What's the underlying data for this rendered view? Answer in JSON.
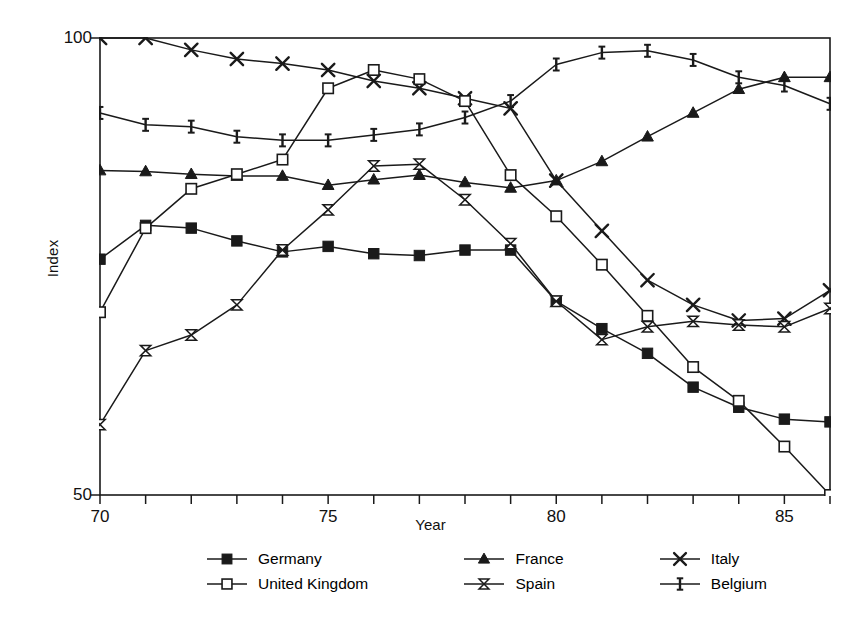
{
  "chart_data": {
    "type": "line",
    "title": "",
    "xlabel": "Year",
    "ylabel": "Index",
    "xlim": [
      70,
      86
    ],
    "ylim": [
      50,
      100
    ],
    "grid": false,
    "legend_position": "bottom",
    "x_tick_labels": [
      "70",
      "75",
      "80",
      "85"
    ],
    "x_tick_values": [
      70,
      75,
      80,
      85
    ],
    "x_minor_ticks": [
      70,
      71,
      72,
      73,
      74,
      75,
      76,
      77,
      78,
      79,
      80,
      81,
      82,
      83,
      84,
      85,
      86
    ],
    "y_tick_labels": [
      "100",
      "50"
    ],
    "y_tick_values": [
      100,
      50
    ],
    "x": [
      70,
      71,
      72,
      73,
      74,
      75,
      76,
      77,
      78,
      79,
      80,
      81,
      82,
      83,
      84,
      85,
      86
    ],
    "series": [
      {
        "name": "Germany",
        "marker": "filled-square",
        "values": [
          75.8,
          79.5,
          79.2,
          77.8,
          76.6,
          77.2,
          76.4,
          76.2,
          76.8,
          76.8,
          71.2,
          68.2,
          65.5,
          61.8,
          59.6,
          58.3,
          58.0
        ]
      },
      {
        "name": "France",
        "marker": "filled-triangle",
        "values": [
          85.5,
          85.4,
          85.1,
          84.9,
          84.9,
          83.9,
          84.5,
          85.0,
          84.2,
          83.6,
          84.4,
          86.5,
          89.2,
          91.8,
          94.4,
          95.7,
          95.7
        ]
      },
      {
        "name": "Italy",
        "marker": "cross-x",
        "values": [
          100.0,
          100.0,
          98.7,
          97.7,
          97.2,
          96.5,
          95.3,
          94.5,
          93.4,
          92.3,
          84.4,
          78.9,
          73.5,
          70.8,
          69.1,
          69.3,
          72.4
        ]
      },
      {
        "name": "United Kingdom",
        "marker": "open-square",
        "values": [
          70.0,
          79.2,
          83.5,
          85.1,
          86.7,
          94.5,
          96.5,
          95.5,
          93.1,
          85.0,
          80.5,
          75.2,
          69.6,
          64.0,
          60.3,
          55.3,
          50.0
        ]
      },
      {
        "name": "Spain",
        "marker": "bowtie",
        "values": [
          57.7,
          65.8,
          67.5,
          70.8,
          76.8,
          81.2,
          86.0,
          86.2,
          82.3,
          77.5,
          71.2,
          67.0,
          68.4,
          69.0,
          68.6,
          68.4,
          70.4
        ]
      },
      {
        "name": "Belgium",
        "marker": "i-bar",
        "values": [
          91.8,
          90.5,
          90.3,
          89.2,
          88.8,
          88.8,
          89.4,
          90.0,
          91.3,
          93.1,
          97.1,
          98.4,
          98.6,
          97.6,
          95.7,
          94.8,
          92.8
        ]
      }
    ]
  },
  "axes": {
    "x_axis_label": "Year",
    "y_axis_label": "Index"
  },
  "legend": {
    "items": [
      {
        "label": "Germany",
        "marker": "filled-square"
      },
      {
        "label": "France",
        "marker": "filled-triangle"
      },
      {
        "label": "Italy",
        "marker": "cross-x"
      },
      {
        "label": "United Kingdom",
        "marker": "open-square"
      },
      {
        "label": "Spain",
        "marker": "bowtie"
      },
      {
        "label": "Belgium",
        "marker": "i-bar"
      }
    ]
  },
  "style": {
    "line_color": "#1a1a1a",
    "background": "#ffffff",
    "axis_color": "#1a1a1a"
  }
}
